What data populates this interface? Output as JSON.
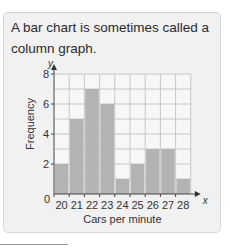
{
  "caption": "A bar chart is sometimes called a column graph.",
  "chart_data": {
    "type": "bar",
    "title": "",
    "categories": [
      "20",
      "21",
      "22",
      "23",
      "24",
      "25",
      "26",
      "27",
      "28"
    ],
    "values": [
      2,
      5,
      7,
      6,
      1,
      2,
      3,
      3,
      1
    ],
    "xlabel": "Cars per minute",
    "ylabel": "Frequency",
    "x_axis_symbol": "x",
    "y_axis_symbol": "y",
    "yticks": [
      0,
      2,
      4,
      6,
      8
    ],
    "ylim": [
      0,
      8
    ],
    "grid": true,
    "bar_color": "#b3b3b3",
    "grid_color": "#c8c8c8"
  }
}
